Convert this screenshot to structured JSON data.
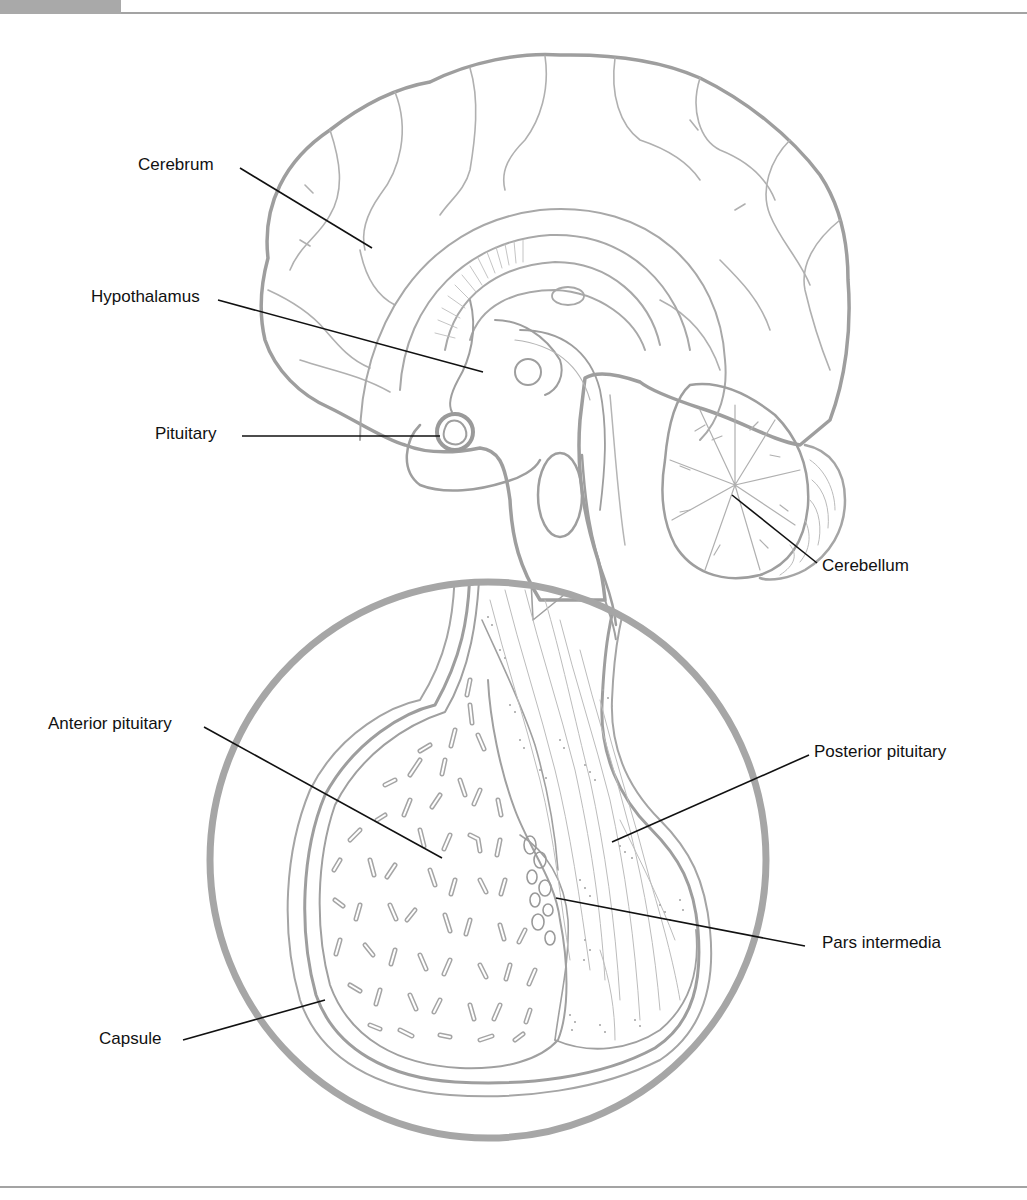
{
  "figure": {
    "type": "anatomical-diagram",
    "colors": {
      "outline": "#9e9e9e",
      "detail": "#b0b0b0",
      "leader": "#111111",
      "header_tab": "#a9a9a9"
    }
  },
  "labels": {
    "cerebrum": "Cerebrum",
    "hypothalamus": "Hypothalamus",
    "pituitary": "Pituitary",
    "cerebellum": "Cerebellum",
    "anterior_pituitary": "Anterior pituitary",
    "posterior_pituitary": "Posterior pituitary",
    "pars_intermedia": "Pars intermedia",
    "capsule": "Capsule"
  }
}
